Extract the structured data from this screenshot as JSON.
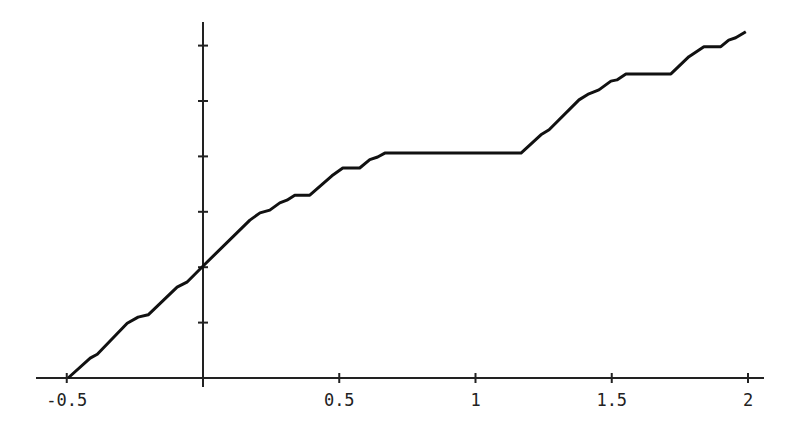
{
  "chart_data": {
    "type": "line",
    "title": "",
    "xlabel": "",
    "ylabel": "",
    "xlim": [
      -0.5,
      2.05
    ],
    "ylim": [
      0,
      0.64
    ],
    "grid": false,
    "legend": null,
    "x_ticks": [
      -0.5,
      0.5,
      1,
      1.5,
      2
    ],
    "x_tick_labels": [
      "-0.5",
      "0.5",
      "1",
      "1.5",
      "2"
    ],
    "y_ticks": [
      0.1,
      0.2,
      0.3,
      0.4,
      0.5,
      0.6
    ],
    "y_tick_labels": [],
    "series": [
      {
        "name": "f(x)",
        "color": "#111111",
        "points": [
          [
            -0.495,
            0.0
          ],
          [
            -0.414,
            0.036
          ],
          [
            -0.388,
            0.043
          ],
          [
            -0.278,
            0.099
          ],
          [
            -0.238,
            0.11
          ],
          [
            -0.201,
            0.114
          ],
          [
            -0.095,
            0.164
          ],
          [
            -0.059,
            0.173
          ],
          [
            0.004,
            0.204
          ],
          [
            0.172,
            0.285
          ],
          [
            0.209,
            0.298
          ],
          [
            0.245,
            0.303
          ],
          [
            0.282,
            0.316
          ],
          [
            0.308,
            0.321
          ],
          [
            0.337,
            0.33
          ],
          [
            0.392,
            0.33
          ],
          [
            0.473,
            0.365
          ],
          [
            0.513,
            0.379
          ],
          [
            0.575,
            0.379
          ],
          [
            0.612,
            0.394
          ],
          [
            0.641,
            0.399
          ],
          [
            0.667,
            0.406
          ],
          [
            1.167,
            0.406
          ],
          [
            1.24,
            0.439
          ],
          [
            1.27,
            0.448
          ],
          [
            1.38,
            0.502
          ],
          [
            1.416,
            0.513
          ],
          [
            1.453,
            0.52
          ],
          [
            1.497,
            0.536
          ],
          [
            1.519,
            0.538
          ],
          [
            1.552,
            0.549
          ],
          [
            1.717,
            0.549
          ],
          [
            1.783,
            0.58
          ],
          [
            1.838,
            0.598
          ],
          [
            1.9,
            0.598
          ],
          [
            1.929,
            0.61
          ],
          [
            1.955,
            0.614
          ],
          [
            1.992,
            0.625
          ]
        ]
      }
    ]
  }
}
